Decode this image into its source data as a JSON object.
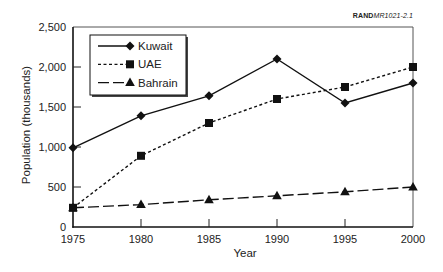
{
  "figure_ref": {
    "bold": "RAND",
    "italic": "MR1021-2.1"
  },
  "chart_data": {
    "type": "line",
    "title": "",
    "xlabel": "Year",
    "ylabel": "Population (thousands)",
    "x": [
      1975,
      1980,
      1985,
      1990,
      1995,
      2000
    ],
    "xlim": [
      1975,
      2000
    ],
    "ylim": [
      0,
      2500
    ],
    "yticks": [
      0,
      500,
      1000,
      1500,
      2000,
      2500
    ],
    "ytick_labels": [
      "0",
      "500",
      "1,000",
      "1,500",
      "2,000",
      "2,500"
    ],
    "xtick_labels": [
      "1975",
      "1980",
      "1985",
      "1990",
      "1995",
      "2000"
    ],
    "grid": false,
    "legend_position": "upper left (boxed, with shadow)",
    "series": [
      {
        "name": "Kuwait",
        "marker": "diamond",
        "line": "solid",
        "values": [
          990,
          1390,
          1640,
          2100,
          1550,
          1800
        ]
      },
      {
        "name": "UAE",
        "marker": "square",
        "line": "dotted",
        "values": [
          240,
          890,
          1300,
          1600,
          1750,
          2000
        ]
      },
      {
        "name": "Bahrain",
        "marker": "triangle",
        "line": "long-dash",
        "values": [
          240,
          280,
          340,
          390,
          440,
          500
        ]
      }
    ]
  }
}
